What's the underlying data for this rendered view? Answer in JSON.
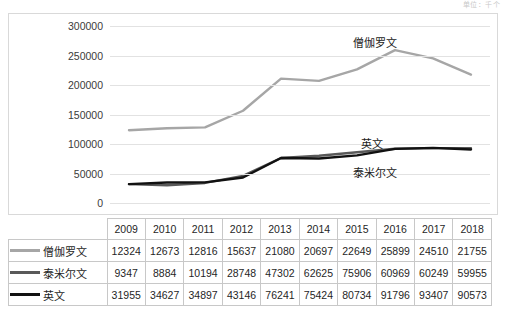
{
  "top_note": "单位：千个",
  "chart_data": {
    "type": "line",
    "title": "",
    "xlabel": "",
    "ylabel": "",
    "ylim": [
      0,
      300000
    ],
    "ytick_values": [
      300000,
      250000,
      200000,
      150000,
      100000,
      50000,
      0
    ],
    "ytick_labels": [
      "300000",
      "250000",
      "200000",
      "150000",
      "100000",
      "50000",
      "0"
    ],
    "grid": true,
    "legend_position": "right-inline",
    "categories": [
      "2009",
      "2010",
      "2011",
      "2012",
      "2013",
      "2014",
      "2015",
      "2016",
      "2017",
      "2018"
    ],
    "series": [
      {
        "name": "僧伽罗文",
        "color": "#a6a6a6",
        "values": [
          12324,
          12673,
          12816,
          15637,
          21080,
          20697,
          22649,
          25899,
          24510,
          21755
        ],
        "plot_values": [
          123240,
          126730,
          128160,
          156370,
          210800,
          206970,
          226490,
          258990,
          245100,
          217550
        ]
      },
      {
        "name": "泰米尔文",
        "color": "#595959",
        "values": [
          9347,
          8884,
          10194,
          28748,
          47302,
          62625,
          75906,
          60969,
          60249,
          59955
        ],
        "plot_values": [
          31955,
          30000,
          34000,
          46000,
          76241,
          80000,
          86000,
          92000,
          93000,
          93000
        ]
      },
      {
        "name": "英文",
        "color": "#111111",
        "values": [
          31955,
          34627,
          34897,
          43146,
          76241,
          75424,
          80734,
          91796,
          93407,
          90573
        ],
        "plot_values": [
          31955,
          34627,
          34897,
          43146,
          76241,
          75424,
          80734,
          91796,
          93407,
          90573
        ]
      }
    ]
  },
  "series_labels": {
    "sinhala": "僧伽罗文",
    "english": "英文",
    "tamil": "泰米尔文"
  },
  "table": {
    "header": [
      "2009",
      "2010",
      "2011",
      "2012",
      "2013",
      "2014",
      "2015",
      "2016",
      "2017",
      "2018"
    ],
    "rows": [
      {
        "label": "僧伽罗文",
        "color": "#a6a6a6",
        "cells": [
          "12324",
          "12673",
          "12816",
          "15637",
          "21080",
          "20697",
          "22649",
          "25899",
          "24510",
          "21755"
        ]
      },
      {
        "label": "泰米尔文",
        "color": "#595959",
        "cells": [
          "9347",
          "8884",
          "10194",
          "28748",
          "47302",
          "62625",
          "75906",
          "60969",
          "60249",
          "59955"
        ]
      },
      {
        "label": "英文",
        "color": "#111111",
        "cells": [
          "31955",
          "34627",
          "34897",
          "43146",
          "76241",
          "75424",
          "80734",
          "91796",
          "93407",
          "90573"
        ]
      }
    ]
  }
}
